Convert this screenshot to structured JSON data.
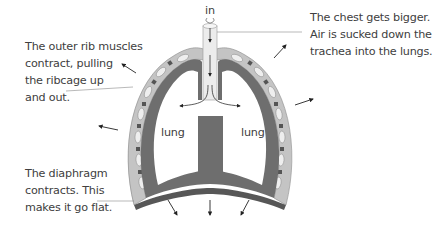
{
  "diagram": {
    "type": "breathing-in-inhalation",
    "labels": {
      "in": "in",
      "lung_left": "lung",
      "lung_right": "lung"
    },
    "annotations": {
      "rib_muscles": [
        "The outer rib muscles",
        "contract, pulling",
        "the ribcage up",
        "and out."
      ],
      "chest": [
        "The chest gets bigger.",
        "Air is sucked down the",
        "trachea into the lungs."
      ],
      "diaphragm": [
        "The diaphragm",
        "contracts. This",
        "makes it go flat."
      ]
    },
    "colors": {
      "wall_dark": "#6e6e6e",
      "wall_light": "#bdbdbd",
      "rib_light": "#e6e6e6",
      "trachea": "#e8e8e8",
      "arrow": "#222222",
      "leader_line": "#8a8a8a",
      "text": "#404040"
    }
  }
}
